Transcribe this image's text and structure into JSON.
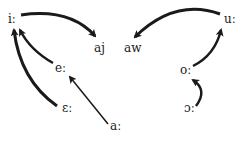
{
  "diagram": {
    "type": "vowel-shift",
    "nodes": [
      {
        "id": "i",
        "label": "iː",
        "x": 8,
        "y": 16
      },
      {
        "id": "e",
        "label": "eː",
        "x": 55,
        "y": 65
      },
      {
        "id": "E",
        "label": "ɛː",
        "x": 62,
        "y": 104
      },
      {
        "id": "a",
        "label": "aː",
        "x": 110,
        "y": 124
      },
      {
        "id": "aj",
        "label": "aj",
        "x": 94,
        "y": 45
      },
      {
        "id": "aw",
        "label": "aw",
        "x": 124,
        "y": 45
      },
      {
        "id": "u",
        "label": "uː",
        "x": 226,
        "y": 16
      },
      {
        "id": "o",
        "label": "oː",
        "x": 180,
        "y": 66
      },
      {
        "id": "O",
        "label": "ɔː",
        "x": 184,
        "y": 104
      }
    ],
    "edges": [
      {
        "from": "iː",
        "to": "aj"
      },
      {
        "from": "eː",
        "to": "iː"
      },
      {
        "from": "ɛː",
        "to": "iː"
      },
      {
        "from": "aː",
        "to": "eː"
      },
      {
        "from": "uː",
        "to": "aw"
      },
      {
        "from": "oː",
        "to": "uː"
      },
      {
        "from": "ɔː",
        "to": "oː"
      }
    ],
    "colors": {
      "ink": "#1a1a1a",
      "background": "#ffffff"
    }
  }
}
